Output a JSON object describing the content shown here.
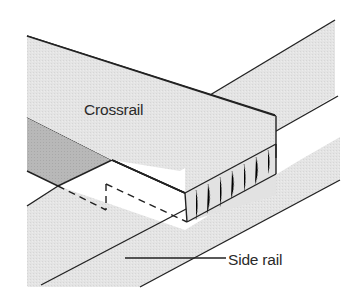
{
  "diagram": {
    "labels": {
      "crossrail": "Crossrail",
      "side_rail": "Side rail"
    },
    "colors": {
      "background": "#ffffff",
      "wood_fill": "#e3e3e3",
      "shaded_end": "#b5b5b5",
      "end_grain": "#dcdcdc",
      "line": "#222222"
    }
  }
}
